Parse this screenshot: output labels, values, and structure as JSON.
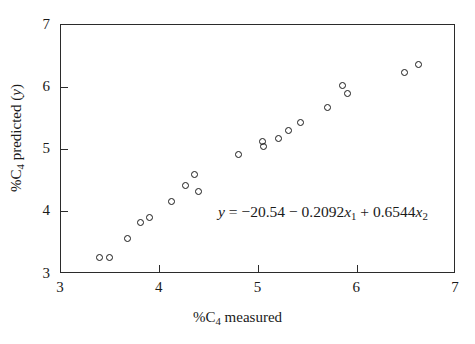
{
  "chart_data": {
    "type": "scatter",
    "title": "",
    "xlabel": "%C4 measured",
    "ylabel": "%C4 predicted (y)",
    "xlim": [
      3,
      7
    ],
    "ylim": [
      3,
      7
    ],
    "xticks": [
      3,
      4,
      5,
      6,
      7
    ],
    "yticks": [
      3,
      4,
      5,
      6,
      7
    ],
    "xtick_labels": [
      "3",
      "4",
      "5",
      "6",
      "7"
    ],
    "ytick_labels": [
      "3",
      "4",
      "5",
      "6",
      "7"
    ],
    "grid": false,
    "legend": null,
    "marker": "open-circle",
    "annotation": "y = -20.54 - 0.2092x1 + 0.6544x2",
    "x": [
      3.39,
      3.49,
      3.67,
      3.8,
      3.9,
      4.12,
      4.26,
      4.35,
      4.39,
      4.8,
      5.04,
      5.05,
      5.2,
      5.3,
      5.43,
      5.7,
      5.85,
      5.9,
      6.48,
      6.62
    ],
    "y": [
      3.27,
      3.27,
      3.57,
      3.83,
      3.91,
      4.17,
      4.42,
      4.6,
      4.33,
      4.92,
      5.13,
      5.05,
      5.17,
      5.3,
      5.43,
      5.68,
      6.03,
      5.9,
      6.24,
      6.37
    ],
    "points": [
      {
        "x": 3.39,
        "y": 3.27
      },
      {
        "x": 3.49,
        "y": 3.27
      },
      {
        "x": 3.67,
        "y": 3.57
      },
      {
        "x": 3.8,
        "y": 3.83
      },
      {
        "x": 3.9,
        "y": 3.91
      },
      {
        "x": 4.12,
        "y": 4.17
      },
      {
        "x": 4.26,
        "y": 4.42
      },
      {
        "x": 4.35,
        "y": 4.6
      },
      {
        "x": 4.39,
        "y": 4.33
      },
      {
        "x": 4.8,
        "y": 4.92
      },
      {
        "x": 5.04,
        "y": 5.13
      },
      {
        "x": 5.05,
        "y": 5.05
      },
      {
        "x": 5.2,
        "y": 5.17
      },
      {
        "x": 5.3,
        "y": 5.3
      },
      {
        "x": 5.43,
        "y": 5.43
      },
      {
        "x": 5.7,
        "y": 5.68
      },
      {
        "x": 5.85,
        "y": 6.03
      },
      {
        "x": 5.9,
        "y": 5.9
      },
      {
        "x": 6.48,
        "y": 6.24
      },
      {
        "x": 6.62,
        "y": 6.37
      }
    ]
  },
  "axis_labels": {
    "x_prefix": "%C",
    "x_sub": "4",
    "x_suffix": " measured",
    "y_prefix": "%C",
    "y_sub": "4",
    "y_mid": " predicted (",
    "y_var": "y",
    "y_suffix": ")"
  },
  "equation": {
    "lhs": "y",
    "eq": " = ",
    "intercept": "−20.54",
    "term1_op": " − ",
    "term1_coef": "0.2092",
    "term1_var": "x",
    "term1_sub": "1",
    "term2_op": " + ",
    "term2_coef": "0.6544",
    "term2_var": "x",
    "term2_sub": "2"
  },
  "colors": {
    "axis": "#2b2b2b",
    "marker": "#1a1a1a",
    "background": "#ffffff"
  }
}
